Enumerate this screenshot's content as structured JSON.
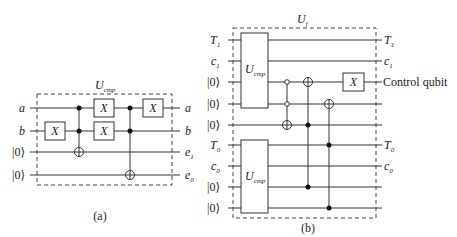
{
  "figure_a": {
    "caption": "(a)",
    "box_label": "U",
    "box_label_sub": "cmp",
    "inputs": [
      "a",
      "b",
      "|0⟩",
      "|0⟩"
    ],
    "outputs": [
      {
        "main": "a",
        "sub": ""
      },
      {
        "main": "b",
        "sub": ""
      },
      {
        "main": "e",
        "sub": "1"
      },
      {
        "main": "e",
        "sub": "0"
      }
    ],
    "gate_label": "X"
  },
  "figure_b": {
    "caption": "(b)",
    "box_label": "U",
    "box_label_sub": "f",
    "inputs": [
      {
        "main": "T",
        "sub": "1"
      },
      {
        "main": "c",
        "sub": "1"
      },
      {
        "main": "|0⟩",
        "sub": ""
      },
      {
        "main": "|0⟩",
        "sub": ""
      },
      {
        "main": "|0⟩",
        "sub": ""
      },
      {
        "main": "T",
        "sub": "0"
      },
      {
        "main": "c",
        "sub": "0"
      },
      {
        "main": "|0⟩",
        "sub": ""
      },
      {
        "main": "|0⟩",
        "sub": ""
      }
    ],
    "outputs": [
      {
        "main": "T",
        "sub": "1"
      },
      {
        "main": "c",
        "sub": "1"
      },
      {
        "main": "Control qubit",
        "sub": ""
      },
      {
        "main": "T",
        "sub": "0"
      },
      {
        "main": "c",
        "sub": "0"
      }
    ],
    "subblock_label": "U",
    "subblock_label_sub": "cmp",
    "gate_label": "X"
  }
}
